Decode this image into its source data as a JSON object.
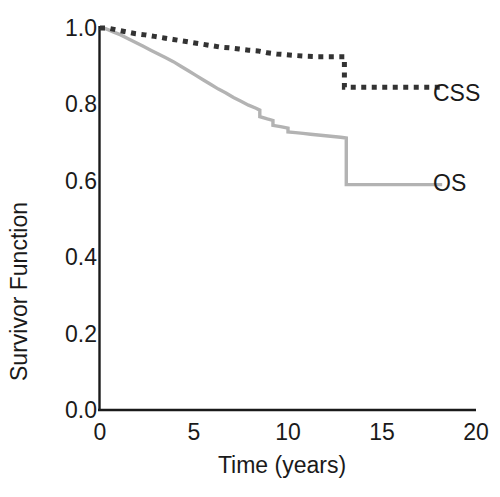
{
  "chart_data": {
    "type": "line",
    "title": "",
    "xlabel": "Time (years)",
    "ylabel": "Survivor Function",
    "xlim": [
      0,
      20
    ],
    "ylim": [
      0.0,
      1.0
    ],
    "xticks": [
      0,
      5,
      10,
      15,
      20
    ],
    "xtick_labels": [
      "0",
      "5",
      "10",
      "15",
      "20"
    ],
    "yticks": [
      0.0,
      0.2,
      0.4,
      0.6,
      0.8,
      1.0
    ],
    "ytick_labels": [
      "0.0",
      "0.2",
      "0.4",
      "0.6",
      "0.8",
      "1.0"
    ],
    "grid": false,
    "legend_position": "right-inline",
    "series": [
      {
        "name": "CSS",
        "label": "CSS",
        "style": "dotted",
        "color": "#333333",
        "x": [
          0.0,
          0.4,
          0.9,
          1.4,
          1.9,
          2.4,
          2.9,
          3.4,
          3.9,
          4.4,
          4.9,
          5.4,
          5.9,
          6.4,
          6.9,
          7.4,
          7.9,
          8.4,
          8.9,
          9.4,
          9.9,
          10.4,
          11.0,
          11.6,
          12.2,
          12.8,
          13.0,
          13.0,
          14.0,
          15.0,
          16.0,
          17.0,
          18.2
        ],
        "y": [
          1.0,
          1.0,
          0.995,
          0.99,
          0.985,
          0.982,
          0.978,
          0.974,
          0.97,
          0.966,
          0.962,
          0.958,
          0.954,
          0.95,
          0.948,
          0.945,
          0.942,
          0.94,
          0.935,
          0.932,
          0.93,
          0.928,
          0.926,
          0.925,
          0.925,
          0.925,
          0.925,
          0.845,
          0.845,
          0.845,
          0.845,
          0.845,
          0.845
        ]
      },
      {
        "name": "OS",
        "label": "OS",
        "style": "solid",
        "color": "#b3b3b3",
        "x": [
          0.0,
          0.3,
          0.7,
          1.1,
          1.5,
          1.9,
          2.3,
          2.7,
          3.1,
          3.5,
          3.9,
          4.3,
          4.7,
          5.1,
          5.5,
          5.9,
          6.3,
          6.7,
          7.1,
          7.5,
          7.9,
          8.3,
          8.5,
          8.5,
          8.9,
          9.2,
          9.2,
          9.6,
          10.0,
          10.0,
          10.4,
          10.8,
          11.2,
          11.6,
          12.0,
          12.4,
          12.8,
          13.1,
          13.1,
          14.0,
          15.0,
          16.0,
          17.0,
          18.2
        ],
        "y": [
          1.0,
          0.998,
          0.99,
          0.982,
          0.972,
          0.962,
          0.952,
          0.942,
          0.932,
          0.922,
          0.912,
          0.9,
          0.888,
          0.876,
          0.864,
          0.852,
          0.84,
          0.83,
          0.818,
          0.808,
          0.798,
          0.79,
          0.785,
          0.768,
          0.762,
          0.758,
          0.745,
          0.742,
          0.738,
          0.728,
          0.726,
          0.724,
          0.722,
          0.72,
          0.718,
          0.716,
          0.714,
          0.712,
          0.59,
          0.59,
          0.59,
          0.59,
          0.59,
          0.59
        ]
      }
    ]
  },
  "axis": {
    "color": "#1a1a1a"
  }
}
